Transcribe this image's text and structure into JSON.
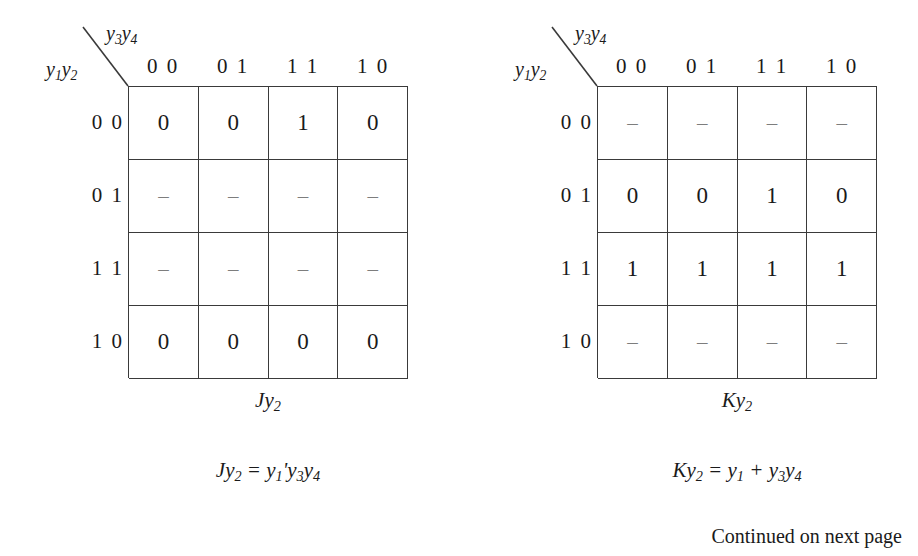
{
  "page": {
    "footer_note": "Continued on next page"
  },
  "maps": [
    {
      "id": "jy2",
      "col_var": "y3y4",
      "row_var": "y1y2",
      "col_headers": [
        "0 0",
        "0 1",
        "1 1",
        "1 0"
      ],
      "row_headers": [
        "0 0",
        "0 1",
        "1 1",
        "1 0"
      ],
      "caption": "Jy2",
      "equation": "Jy2 = y1'y3y4",
      "rows": [
        [
          "0",
          "0",
          "1",
          "0"
        ],
        [
          "–",
          "–",
          "–",
          "–"
        ],
        [
          "–",
          "–",
          "–",
          "–"
        ],
        [
          "0",
          "0",
          "0",
          "0"
        ]
      ]
    },
    {
      "id": "ky2",
      "col_var": "y3y4",
      "row_var": "y1y2",
      "col_headers": [
        "0 0",
        "0 1",
        "1 1",
        "1 0"
      ],
      "row_headers": [
        "0 0",
        "0 1",
        "1 1",
        "1 0"
      ],
      "caption": "Ky2",
      "equation": "Ky2 = y1 + y3y4",
      "rows": [
        [
          "–",
          "–",
          "–",
          "–"
        ],
        [
          "0",
          "0",
          "1",
          "0"
        ],
        [
          "1",
          "1",
          "1",
          "1"
        ],
        [
          "–",
          "–",
          "–",
          "–"
        ]
      ]
    }
  ],
  "colors": {
    "ink": "#1a1a1a",
    "rule": "#3a3a3a",
    "dont_care": "#7d7d7d",
    "background": "#ffffff"
  }
}
